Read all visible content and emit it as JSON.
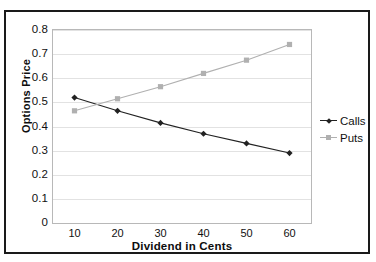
{
  "chart_data": {
    "type": "line",
    "title": "",
    "xlabel": "Dividend in Cents",
    "ylabel": "Options Price",
    "x": [
      10,
      20,
      30,
      40,
      50,
      60
    ],
    "xticklabels": [
      "10",
      "20",
      "30",
      "40",
      "50",
      "60"
    ],
    "yticks": [
      0,
      0.1,
      0.2,
      0.3,
      0.4,
      0.5,
      0.6,
      0.7,
      0.8
    ],
    "yticklabels": [
      "0",
      "0.1",
      "0.2",
      "0.3",
      "0.4",
      "0.5",
      "0.6",
      "0.7",
      "0.8"
    ],
    "xlim": [
      5,
      65
    ],
    "ylim": [
      0,
      0.8
    ],
    "grid": "horizontal",
    "legend_position": "right",
    "series": [
      {
        "name": "Calls",
        "marker": "diamond",
        "color": "#222222",
        "values": [
          0.52,
          0.465,
          0.415,
          0.37,
          0.33,
          0.29
        ]
      },
      {
        "name": "Puts",
        "marker": "square",
        "color": "#b0b0b0",
        "values": [
          0.465,
          0.515,
          0.565,
          0.62,
          0.675,
          0.74
        ]
      }
    ]
  },
  "legend": {
    "items": [
      {
        "label": "Calls"
      },
      {
        "label": "Puts"
      }
    ]
  },
  "colors": {
    "calls": "#222222",
    "puts": "#b0b0b0",
    "grid": "#e2e2e2",
    "frame": "#1a1a1a",
    "plot_border": "#b8b8b8",
    "text": "#111111"
  }
}
